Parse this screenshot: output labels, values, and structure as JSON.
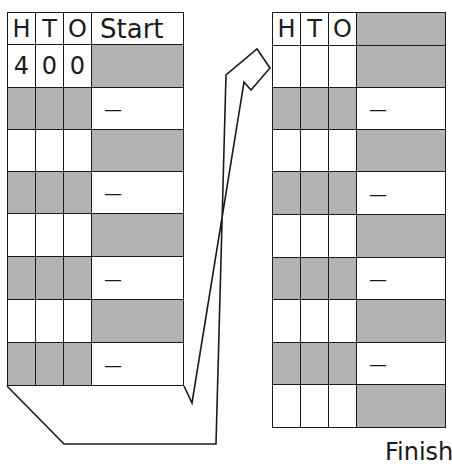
{
  "left_table": {
    "headers": [
      "H",
      "T",
      "O",
      "Start"
    ],
    "rows": [
      {
        "h": "4",
        "t": "0",
        "o": "0",
        "op": "",
        "shade": "first"
      },
      {
        "h": "",
        "t": "",
        "o": "",
        "op": "—",
        "shade": "hto"
      },
      {
        "h": "",
        "t": "",
        "o": "",
        "op": "",
        "shade": "op"
      },
      {
        "h": "",
        "t": "",
        "o": "",
        "op": "—",
        "shade": "hto"
      },
      {
        "h": "",
        "t": "",
        "o": "",
        "op": "",
        "shade": "op"
      },
      {
        "h": "",
        "t": "",
        "o": "",
        "op": "—",
        "shade": "hto"
      },
      {
        "h": "",
        "t": "",
        "o": "",
        "op": "",
        "shade": "op"
      },
      {
        "h": "",
        "t": "",
        "o": "",
        "op": "—",
        "shade": "hto"
      }
    ]
  },
  "right_table": {
    "headers": [
      "H",
      "T",
      "O",
      ""
    ],
    "rows": [
      {
        "op": "",
        "shade": "op"
      },
      {
        "op": "—",
        "shade": "hto"
      },
      {
        "op": "",
        "shade": "op"
      },
      {
        "op": "—",
        "shade": "hto"
      },
      {
        "op": "",
        "shade": "op"
      },
      {
        "op": "—",
        "shade": "hto"
      },
      {
        "op": "",
        "shade": "op"
      },
      {
        "op": "—",
        "shade": "hto"
      },
      {
        "op": "",
        "shade": "op"
      }
    ]
  },
  "finish_label": "Finish",
  "colors": {
    "shade": "#b3b3b3",
    "line": "#1a1a1a"
  }
}
